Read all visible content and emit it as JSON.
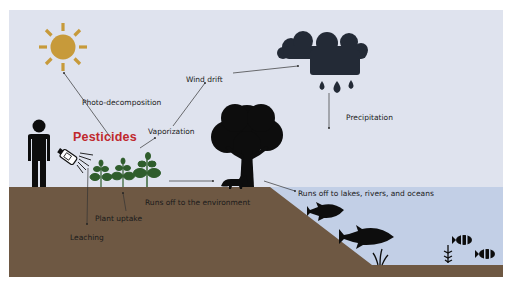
{
  "diagram": {
    "title": "Pesticides",
    "colors": {
      "sky": "#dfe3ee",
      "soil": "#6e5843",
      "water": "#c2cfe6",
      "sun": "#c79a3a",
      "title": "#c0282d",
      "silhouette": "#0d0d0d",
      "cloud": "#232a36",
      "plant": "#2f5d2c"
    },
    "icons": [
      "sun-icon",
      "rain-cloud-icon",
      "person-icon",
      "spray-bottle-icon",
      "plant-icon",
      "tree-icon",
      "fox-icon",
      "fish-icon",
      "clownfish-icon",
      "seaweed-icon"
    ],
    "labels": {
      "photo_decomposition": "Photo-decomposition",
      "wind_drift": "Wind drift",
      "vaporization": "Vaporization",
      "precipitation": "Precipitation",
      "plant_uptake": "Plant uptake",
      "runs_off_environment": "Runs off to the environment",
      "runs_off_water": "Runs off to lakes, rivers, and oceans",
      "leaching": "Leaching"
    }
  }
}
